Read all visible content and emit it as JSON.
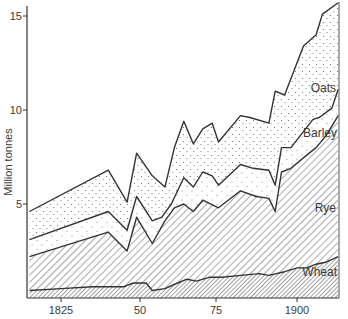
{
  "chart_data": {
    "type": "area",
    "stacked": true,
    "title": "",
    "xlabel": "",
    "ylabel": "Million tonnes",
    "xlim": [
      1815,
      1913
    ],
    "ylim": [
      0,
      15.5
    ],
    "grid": false,
    "legend_position": "inline-labels",
    "x_ticks": [
      {
        "value": 1825,
        "label": "1825"
      },
      {
        "value": 1850,
        "label": "50"
      },
      {
        "value": 1875,
        "label": "75"
      },
      {
        "value": 1900,
        "label": "1900"
      }
    ],
    "y_ticks": [
      {
        "value": 5,
        "label": "5"
      },
      {
        "value": 10,
        "label": "10"
      },
      {
        "value": 15,
        "label": "15"
      }
    ],
    "series_order_bottom_to_top": [
      "Wheat",
      "Rye",
      "Barley",
      "Oats"
    ],
    "cumulative_lines": [
      {
        "name": "Wheat",
        "pattern": "dense-diagonal-hatch",
        "points": [
          [
            1815,
            0.4
          ],
          [
            1825,
            0.5
          ],
          [
            1835,
            0.6
          ],
          [
            1845,
            0.6
          ],
          [
            1848,
            0.8
          ],
          [
            1852,
            0.8
          ],
          [
            1854,
            0.4
          ],
          [
            1858,
            0.5
          ],
          [
            1862,
            0.8
          ],
          [
            1865,
            1.0
          ],
          [
            1868,
            0.9
          ],
          [
            1872,
            1.1
          ],
          [
            1876,
            1.1
          ],
          [
            1882,
            1.2
          ],
          [
            1888,
            1.3
          ],
          [
            1891,
            1.2
          ],
          [
            1896,
            1.4
          ],
          [
            1900,
            1.6
          ],
          [
            1903,
            1.6
          ],
          [
            1906,
            1.8
          ],
          [
            1909,
            1.9
          ],
          [
            1913,
            2.2
          ]
        ]
      },
      {
        "name": "Rye",
        "pattern": "diagonal-hatch",
        "points": [
          [
            1815,
            2.2
          ],
          [
            1840,
            3.5
          ],
          [
            1846,
            2.5
          ],
          [
            1849,
            4.3
          ],
          [
            1854,
            2.9
          ],
          [
            1858,
            4.1
          ],
          [
            1861,
            4.8
          ],
          [
            1864,
            5.0
          ],
          [
            1867,
            4.6
          ],
          [
            1870,
            5.2
          ],
          [
            1875,
            4.8
          ],
          [
            1882,
            5.7
          ],
          [
            1887,
            5.4
          ],
          [
            1891,
            5.3
          ],
          [
            1893,
            4.6
          ],
          [
            1895,
            6.7
          ],
          [
            1898,
            6.9
          ],
          [
            1903,
            7.6
          ],
          [
            1906,
            8.0
          ],
          [
            1909,
            8.6
          ],
          [
            1913,
            9.7
          ]
        ]
      },
      {
        "name": "Barley",
        "pattern": "sparse-dots",
        "points": [
          [
            1815,
            3.1
          ],
          [
            1840,
            4.6
          ],
          [
            1846,
            3.6
          ],
          [
            1849,
            5.4
          ],
          [
            1854,
            4.1
          ],
          [
            1857,
            4.3
          ],
          [
            1860,
            5.0
          ],
          [
            1864,
            6.4
          ],
          [
            1867,
            5.9
          ],
          [
            1870,
            6.7
          ],
          [
            1873,
            6.5
          ],
          [
            1875,
            6.0
          ],
          [
            1882,
            7.1
          ],
          [
            1886,
            6.9
          ],
          [
            1891,
            6.8
          ],
          [
            1893,
            6.0
          ],
          [
            1895,
            8.0
          ],
          [
            1898,
            8.0
          ],
          [
            1905,
            9.5
          ],
          [
            1907,
            9.6
          ],
          [
            1911,
            10.1
          ],
          [
            1913,
            11.1
          ]
        ]
      },
      {
        "name": "Oats",
        "pattern": "dots",
        "points": [
          [
            1815,
            4.6
          ],
          [
            1840,
            6.8
          ],
          [
            1846,
            5.1
          ],
          [
            1849,
            7.7
          ],
          [
            1854,
            6.5
          ],
          [
            1858,
            5.9
          ],
          [
            1861,
            8.0
          ],
          [
            1864,
            9.4
          ],
          [
            1867,
            8.2
          ],
          [
            1870,
            9.0
          ],
          [
            1873,
            9.3
          ],
          [
            1875,
            8.3
          ],
          [
            1882,
            9.7
          ],
          [
            1885,
            9.6
          ],
          [
            1891,
            9.3
          ],
          [
            1893,
            11.0
          ],
          [
            1896,
            10.8
          ],
          [
            1902,
            13.4
          ],
          [
            1906,
            14.0
          ],
          [
            1908,
            15.1
          ],
          [
            1913,
            15.7
          ]
        ]
      }
    ],
    "annotations": [
      {
        "text": "Oats",
        "x": 1910,
        "y": 11.5
      },
      {
        "text": "Barley",
        "x": 1908,
        "y": 8.9
      },
      {
        "text": "Rye",
        "x": 1910,
        "y": 5.1
      },
      {
        "text": "Wheat",
        "x": 1908,
        "y": 1.5
      }
    ]
  },
  "labels": {
    "y_axis": "Million tonnes",
    "y15": "15",
    "y10": "10",
    "y5": "5",
    "x1825": "1825",
    "x50": "50",
    "x75": "75",
    "x1900": "1900",
    "oats": "Oats",
    "barley": "Barley",
    "rye": "Rye",
    "wheat": "Wheat"
  }
}
